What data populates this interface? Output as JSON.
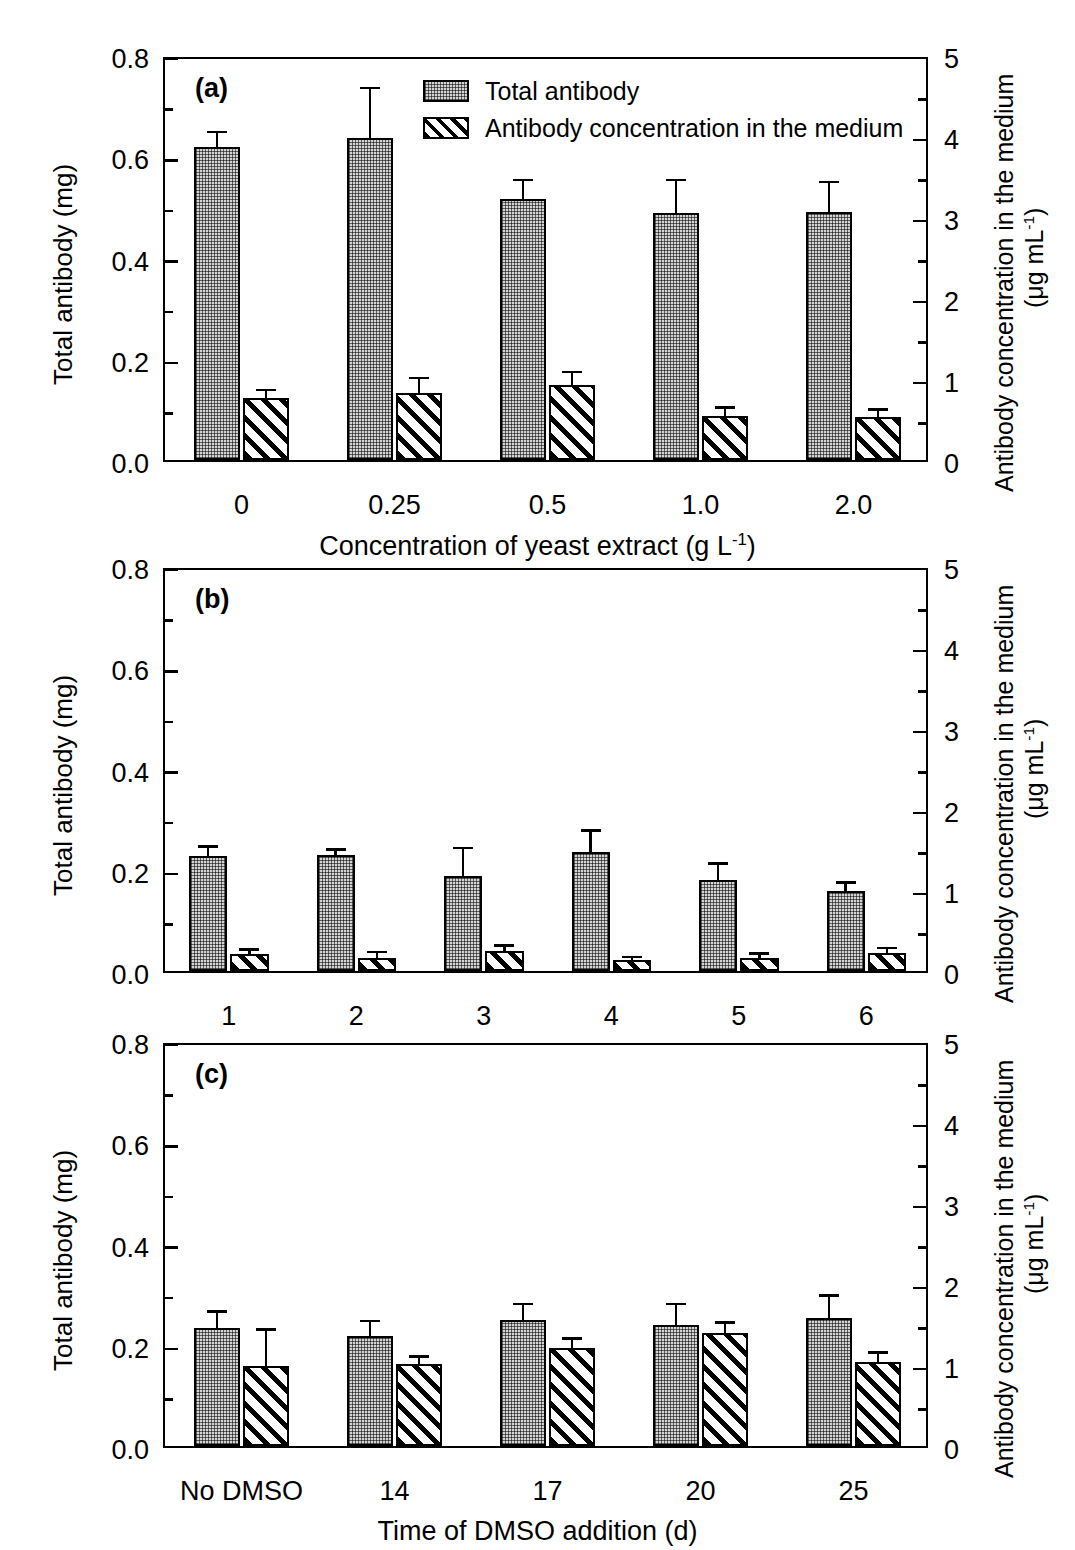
{
  "figure": {
    "axes": {
      "left_title": "Total antibody (mg)",
      "right_title_line1": "Antibody concentration in the medium",
      "right_title_line2": "(μg mL",
      "right_title_sup": "-1",
      "right_title_close": ")",
      "left_ticks": [
        "0.0",
        "0.2",
        "0.4",
        "0.6",
        "0.8"
      ],
      "right_ticks": [
        "0",
        "1",
        "2",
        "3",
        "4",
        "5"
      ]
    },
    "legend": {
      "items": [
        {
          "label": "Total antibody",
          "pattern": "dotted-stipple"
        },
        {
          "label": "Antibody concentration in the medium",
          "pattern": "diagonal-hatch"
        }
      ]
    }
  },
  "chart_data": [
    {
      "type": "bar",
      "panel": "a",
      "panel_tag": "(a)",
      "title": "",
      "xlabel_prefix": "Concentration of yeast extract (g L",
      "xlabel_sup": "-1",
      "xlabel_suffix": ")",
      "ylabel": "Total antibody (mg)",
      "y2label": "Antibody concentration in the medium (μg mL-1)",
      "ylim": [
        0.0,
        0.8
      ],
      "y2lim": [
        0,
        5
      ],
      "grid": false,
      "legend_position": "top-right",
      "categories": [
        "0",
        "0.25",
        "0.5",
        "1.0",
        "2.0"
      ],
      "series": [
        {
          "name": "Total antibody",
          "unit": "mg",
          "values": [
            0.618,
            0.637,
            0.515,
            0.487,
            0.489
          ],
          "errors": [
            0.027,
            0.095,
            0.036,
            0.064,
            0.058
          ]
        },
        {
          "name": "Antibody concentration in the medium",
          "unit": "μg mL-1",
          "values": [
            0.76,
            0.83,
            0.93,
            0.54,
            0.53
          ],
          "errors": [
            0.09,
            0.17,
            0.14,
            0.09,
            0.08
          ]
        }
      ]
    },
    {
      "type": "bar",
      "panel": "b",
      "panel_tag": "(b)",
      "title": "",
      "xlabel_prefix": "Medium",
      "xlabel_sup": "",
      "xlabel_suffix": "",
      "ylabel": "Total antibody (mg)",
      "y2label": "Antibody concentration in the medium (μg mL-1)",
      "ylim": [
        0.0,
        0.8
      ],
      "y2lim": [
        0,
        5
      ],
      "grid": false,
      "legend_position": "none",
      "categories": [
        "1",
        "2",
        "3",
        "4",
        "5",
        "6"
      ],
      "series": [
        {
          "name": "Total antibody",
          "unit": "mg",
          "values": [
            0.228,
            0.229,
            0.188,
            0.235,
            0.18,
            0.158
          ],
          "errors": [
            0.015,
            0.009,
            0.053,
            0.04,
            0.03,
            0.014
          ]
        },
        {
          "name": "Antibody concentration in the medium",
          "unit": "μg mL-1",
          "values": [
            0.21,
            0.16,
            0.25,
            0.13,
            0.16,
            0.22
          ],
          "errors": [
            0.04,
            0.06,
            0.05,
            0.03,
            0.04,
            0.05
          ]
        }
      ]
    },
    {
      "type": "bar",
      "panel": "c",
      "panel_tag": "(c)",
      "title": "",
      "xlabel_prefix": "Time of DMSO addition (d)",
      "xlabel_sup": "",
      "xlabel_suffix": "",
      "ylabel": "Total antibody (mg)",
      "y2label": "Antibody concentration in the medium (μg mL-1)",
      "ylim": [
        0.0,
        0.8
      ],
      "y2lim": [
        0,
        5
      ],
      "grid": false,
      "legend_position": "none",
      "categories": [
        "No DMSO",
        "14",
        "17",
        "20",
        "25"
      ],
      "series": [
        {
          "name": "Total antibody",
          "unit": "mg",
          "values": [
            0.234,
            0.218,
            0.249,
            0.24,
            0.252
          ],
          "errors": [
            0.029,
            0.026,
            0.029,
            0.038,
            0.043
          ]
        },
        {
          "name": "Antibody concentration in the medium",
          "unit": "μg mL-1",
          "values": [
            0.99,
            1.01,
            1.21,
            1.39,
            1.04
          ],
          "errors": [
            0.43,
            0.08,
            0.1,
            0.12,
            0.1
          ]
        }
      ]
    }
  ]
}
